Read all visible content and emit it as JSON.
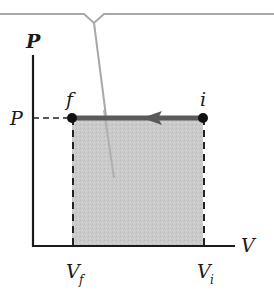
{
  "diagram": {
    "type": "pv-diagram",
    "axes": {
      "y_label": "P",
      "x_label": "V"
    },
    "pressure_tick": "P",
    "points": {
      "initial": {
        "label": "i",
        "volume_label": "V",
        "volume_sub": "i"
      },
      "final": {
        "label": "f",
        "volume_label": "V",
        "volume_sub": "f"
      }
    },
    "process": "isobaric compression (arrow from i to f)",
    "shaded_region": "work area under path",
    "colors": {
      "axis": "#1a1a1a",
      "path": "#555555",
      "fill": "#c8c8c8",
      "callout": "#a8a8a8",
      "point": "#111111"
    }
  }
}
